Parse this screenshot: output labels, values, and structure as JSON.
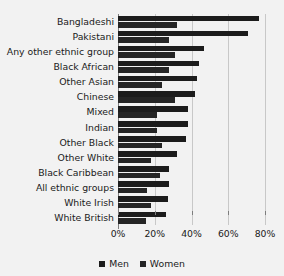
{
  "chart_data": {
    "type": "bar",
    "title": "",
    "xlabel": "",
    "ylabel": "",
    "orientation": "horizontal",
    "grid": true,
    "legend_position": "bottom",
    "xlim": [
      0,
      85
    ],
    "xticks": [
      "0%",
      "20%",
      "40%",
      "60%",
      "80%"
    ],
    "xtick_values": [
      0,
      20,
      40,
      60,
      80
    ],
    "categories": [
      "Bangladeshi",
      "Pakistani",
      "Any other ethnic group",
      "Black African",
      "Other Asian",
      "Chinese",
      "Mixed",
      "Indian",
      "Other Black",
      "Other White",
      "Black Caribbean",
      "All ethnic groups",
      "White Irish",
      "White British"
    ],
    "series": [
      {
        "name": "Men",
        "color": "#1c1c1c",
        "values": [
          77,
          71,
          47,
          44,
          43,
          42,
          38,
          38,
          37,
          32,
          28,
          28,
          27,
          26
        ]
      },
      {
        "name": "Women",
        "color": "#252525",
        "values": [
          32,
          28,
          31,
          28,
          24,
          31,
          21,
          21,
          24,
          18,
          23,
          16,
          18,
          15
        ]
      }
    ]
  },
  "legend": {
    "items": [
      {
        "label": "Men"
      },
      {
        "label": "Women"
      }
    ]
  },
  "colors": {
    "background": "#f2f2f2",
    "bar_men": "#1c1c1c",
    "bar_women": "#252525",
    "gridline": "#c8c8c8",
    "axis": "#7d7d7d",
    "text": "#1a1a1a"
  }
}
